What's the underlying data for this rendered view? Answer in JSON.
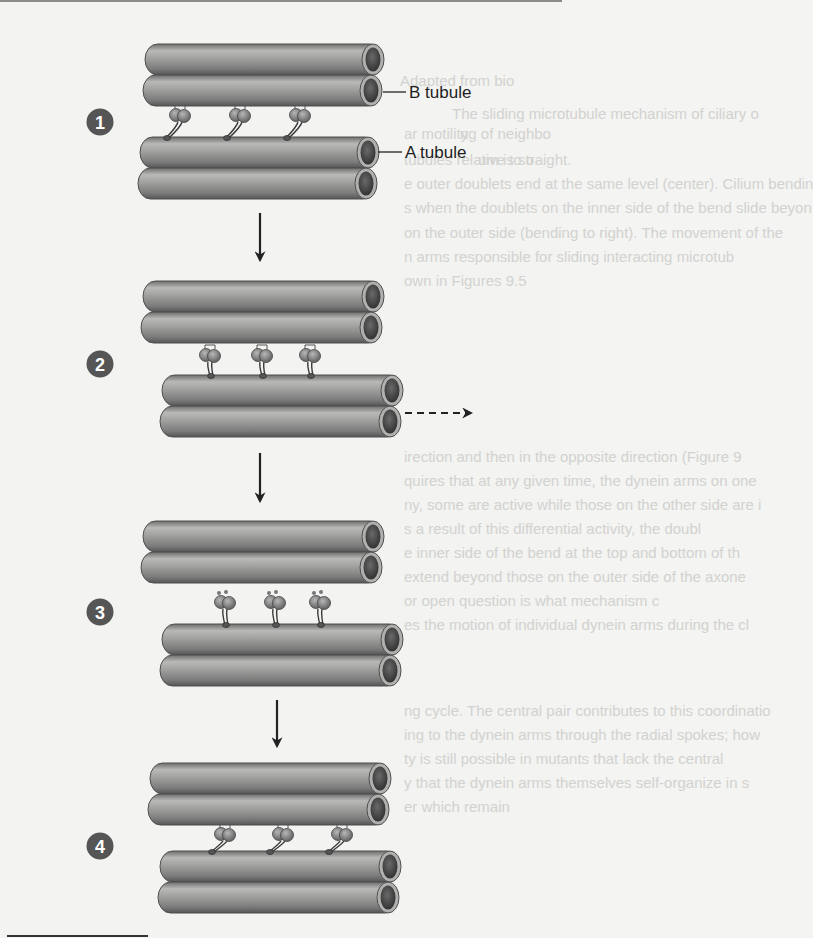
{
  "figure": {
    "labels": {
      "b_tubule": "B tubule",
      "a_tubule": "A tubule"
    },
    "colors": {
      "background": "#f3f3f1",
      "tube_body": "#8e8e8e",
      "tube_highlight": "#b8b8b6",
      "tube_shadow": "#5a5a5a",
      "tube_rim": "#aaaaaa",
      "tube_lumen": "#4a4a4a",
      "badge": "#555555",
      "arrow": "#222222",
      "dynein": "#7a7a7a"
    },
    "steps": [
      {
        "number": "1",
        "description": "Dynein arms attached to B tubule of neighboring doublet",
        "badge": {
          "cx": 100,
          "cy": 122
        },
        "upper_doublet": {
          "x": 145,
          "y": 44,
          "w": 238
        },
        "lower_doublet": {
          "x": 140,
          "y": 137,
          "w": 238
        },
        "dynein": {
          "state": "attached-angled",
          "xs": [
            180,
            240,
            300
          ],
          "head_y": 115,
          "foot_y": 137
        }
      },
      {
        "number": "2",
        "description": "Power stroke slides lower doublet",
        "badge": {
          "cx": 100,
          "cy": 364
        },
        "upper_doublet": {
          "x": 143,
          "y": 281,
          "w": 240
        },
        "lower_doublet": {
          "x": 162,
          "y": 375,
          "w": 240
        },
        "dynein": {
          "state": "attached-vertical",
          "xs": [
            210,
            262,
            310
          ],
          "head_y": 355,
          "foot_y": 375
        },
        "motion_arrow": {
          "x1": 405,
          "y": 413,
          "x2": 475,
          "style": "dashed"
        }
      },
      {
        "number": "3",
        "description": "Dynein arms detach",
        "badge": {
          "cx": 100,
          "cy": 612
        },
        "upper_doublet": {
          "x": 143,
          "y": 521,
          "w": 240
        },
        "lower_doublet": {
          "x": 162,
          "y": 624,
          "w": 240
        },
        "dynein": {
          "state": "detached",
          "xs": [
            225,
            275,
            320
          ],
          "head_y": 602,
          "foot_y": 624
        }
      },
      {
        "number": "4",
        "description": "Dynein arms reattach further along",
        "badge": {
          "cx": 100,
          "cy": 846
        },
        "upper_doublet": {
          "x": 150,
          "y": 763,
          "w": 240
        },
        "lower_doublet": {
          "x": 160,
          "y": 851,
          "w": 240
        },
        "dynein": {
          "state": "attached-angled",
          "xs": [
            225,
            283,
            342
          ],
          "head_y": 834,
          "foot_y": 851
        }
      }
    ],
    "step_arrows": [
      {
        "x": 260,
        "y1": 213,
        "y2": 263
      },
      {
        "x": 260,
        "y1": 453,
        "y2": 504
      },
      {
        "x": 277,
        "y1": 700,
        "y2": 749
      }
    ],
    "callouts": [
      {
        "label_key": "b_tubule",
        "line_x1": 383,
        "line_x2": 406,
        "y": 92,
        "text_x": 409,
        "text_y": 98
      },
      {
        "label_key": "a_tubule",
        "line_x1": 378,
        "line_x2": 402,
        "y": 152,
        "text_x": 405,
        "text_y": 158
      }
    ]
  },
  "bleed_through_text": [
    {
      "text": "Adapted from bio",
      "x": 400,
      "y": 86
    },
    {
      "text": "The sliding microtubule mechanism of ciliary o",
      "x": 452,
      "y": 119
    },
    {
      "text": "ar motility",
      "x": 404,
      "y": 139
    },
    {
      "text": "ng of neighbo",
      "x": 460,
      "y": 139
    },
    {
      "text": "tubules relative to o",
      "x": 404,
      "y": 165
    },
    {
      "text": "um is straight.",
      "x": 478,
      "y": 165
    },
    {
      "text": "e outer doublets end at the same level (center). Cilium bendin",
      "x": 404,
      "y": 189
    },
    {
      "text": "s when the doublets on the inner side of the bend slide beyon",
      "x": 404,
      "y": 213
    },
    {
      "text": "on the outer side (bending to right). The movement of the",
      "x": 404,
      "y": 238
    },
    {
      "text": "n arms responsible for sliding interacting microtub",
      "x": 404,
      "y": 262
    },
    {
      "text": "own in Figures 9.5",
      "x": 404,
      "y": 286
    },
    {
      "text": "irection and then in the opposite direction (Figure 9",
      "x": 404,
      "y": 462
    },
    {
      "text": "quires that at any given time, the dynein arms on one",
      "x": 404,
      "y": 486
    },
    {
      "text": "ny, some are active while those on the other side are i",
      "x": 404,
      "y": 510
    },
    {
      "text": "s a result of this differential activity, the doubl",
      "x": 404,
      "y": 534
    },
    {
      "text": "e inner side of the bend at the top and bottom of th",
      "x": 404,
      "y": 558
    },
    {
      "text": "extend beyond those on the outer side of the axone",
      "x": 404,
      "y": 582
    },
    {
      "text": "or open question is what mechanism c",
      "x": 404,
      "y": 606
    },
    {
      "text": "es the motion of individual dynein arms during the cl",
      "x": 404,
      "y": 630
    },
    {
      "text": "ng cycle. The central pair contributes to this coordinatio",
      "x": 404,
      "y": 716
    },
    {
      "text": "ing to the dynein arms through the radial spokes; how",
      "x": 404,
      "y": 740
    },
    {
      "text": "ty is still possible in mutants that lack the central",
      "x": 404,
      "y": 764
    },
    {
      "text": "y that the dynein arms themselves self-organize in s",
      "x": 404,
      "y": 788
    },
    {
      "text": "er which remain",
      "x": 404,
      "y": 812
    }
  ]
}
